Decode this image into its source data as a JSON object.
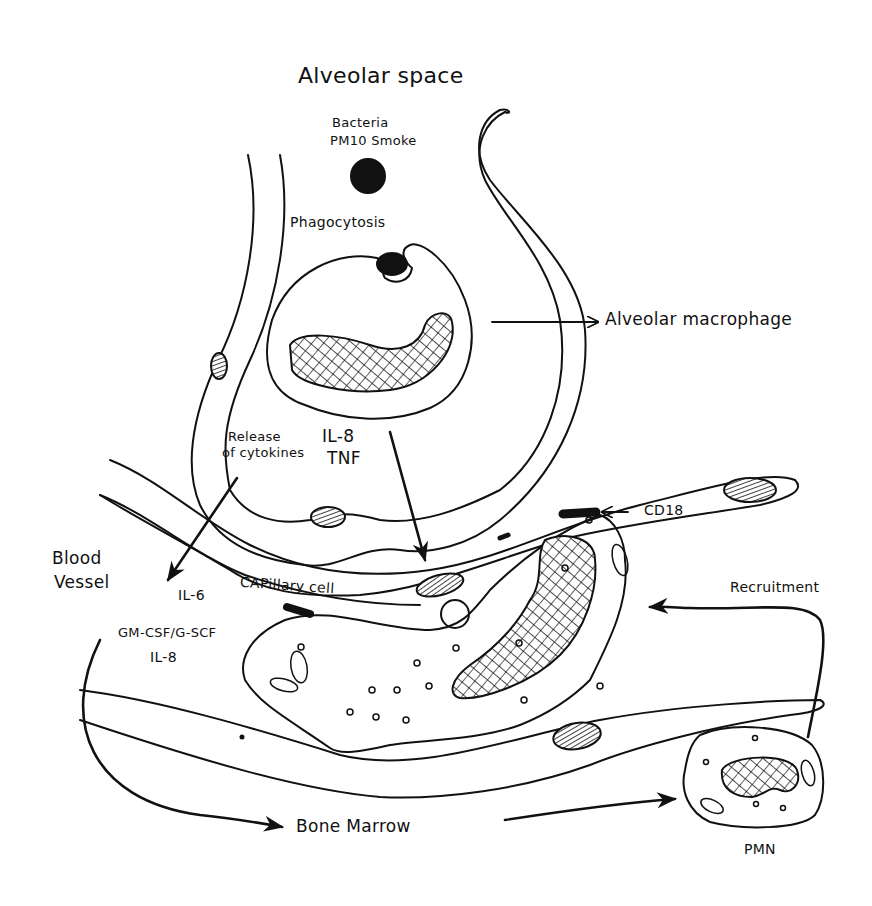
{
  "diagram": {
    "title": "Alveolar space",
    "stroke_color": "#111111",
    "background": "#ffffff",
    "labels": {
      "alveolar_space": "Alveolar space",
      "bacteria_line1": "Bacteria",
      "bacteria_line2": "PM10 Smoke",
      "phagocytosis": "Phagocytosis",
      "alveolar_macrophage": "Alveolar macrophage",
      "release_line1": "Release",
      "release_line2": "of cytokines",
      "il8_top": "IL-8",
      "tnf": "TNF",
      "blood_line1": "Blood",
      "blood_line2": "Vessel",
      "il6": "IL-6",
      "capillary_cell": "CAPillary cell",
      "gmcsf": "GM-CSF/G-SCF",
      "il8_bottom": "IL-8",
      "cd18": "CD18",
      "recruitment": "Recruitment",
      "bone_marrow": "Bone Marrow",
      "pmn": "PMN"
    },
    "nodes": [
      {
        "id": "particle",
        "label": "Bacteria / PM10 Smoke"
      },
      {
        "id": "macrophage",
        "label": "Alveolar macrophage"
      },
      {
        "id": "capillary",
        "label": "CAPillary cell"
      },
      {
        "id": "neutrophil_adherent",
        "label": "Neutrophil (CD18 adhesion)"
      },
      {
        "id": "bone_marrow",
        "label": "Bone Marrow"
      },
      {
        "id": "pmn",
        "label": "PMN"
      }
    ],
    "edges": [
      {
        "from": "macrophage",
        "to": "capillary",
        "label": "IL-8 / TNF"
      },
      {
        "from": "macrophage",
        "to": "blood_vessel",
        "label": "Release of cytokines / IL-6"
      },
      {
        "from": "blood_vessel",
        "to": "bone_marrow",
        "label": "GM-CSF/G-SCF, IL-8"
      },
      {
        "from": "bone_marrow",
        "to": "pmn",
        "label": ""
      },
      {
        "from": "pmn",
        "to": "neutrophil_adherent",
        "label": "Recruitment"
      },
      {
        "from": "cd18_label",
        "to": "neutrophil_adherent",
        "label": "CD18"
      }
    ]
  }
}
